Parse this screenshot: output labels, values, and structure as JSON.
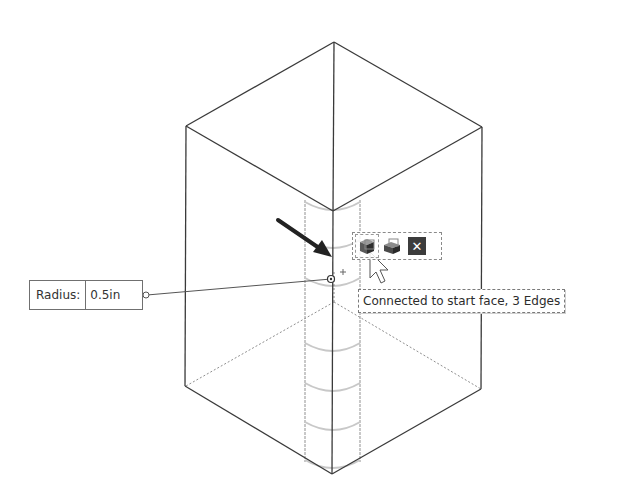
{
  "radius_input": {
    "label": "Radius:",
    "value": "0.5in"
  },
  "context_toolbar": {
    "buttons": [
      {
        "name": "start-face-button",
        "icon": "face-select-icon",
        "active": true
      },
      {
        "name": "extrude-button",
        "icon": "extrude-box-icon",
        "active": false
      },
      {
        "name": "close-button",
        "icon": "close-icon",
        "glyph": "✕",
        "active": false
      }
    ]
  },
  "tooltip": {
    "text": "Connected to start face, 3 Edges"
  },
  "colors": {
    "edge": "#3a3a3a",
    "hidden_edge": "#9a9a9a",
    "cylinder": "#c8c8c8",
    "background": "#ffffff"
  }
}
